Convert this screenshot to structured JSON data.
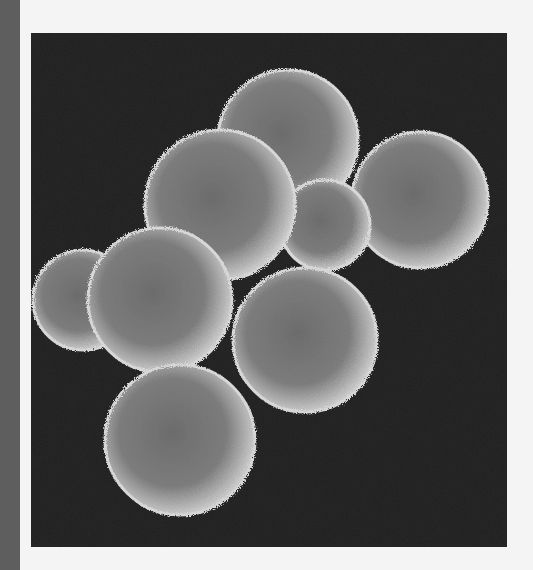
{
  "page": {
    "background_color": "#f4f4f4",
    "left_bar_color": "#5e5e5e"
  },
  "image": {
    "subject": "scanning electron micrograph of a cluster of spherical cells (early embryo / blastomeres)",
    "background_color": "#1f1f1f",
    "cell_count_visible": 8,
    "cells": [
      {
        "name": "cell-far-left",
        "cx": 52,
        "cy": 267,
        "r": 50
      },
      {
        "name": "cell-top-center",
        "cx": 257,
        "cy": 107,
        "r": 70
      },
      {
        "name": "cell-right",
        "cx": 389,
        "cy": 167,
        "r": 68
      },
      {
        "name": "cell-middle-back",
        "cx": 294,
        "cy": 192,
        "r": 45
      },
      {
        "name": "cell-upper-left",
        "cx": 189,
        "cy": 172,
        "r": 75
      },
      {
        "name": "cell-left-middle",
        "cx": 129,
        "cy": 267,
        "r": 72
      },
      {
        "name": "cell-center-right",
        "cx": 274,
        "cy": 307,
        "r": 72
      },
      {
        "name": "cell-bottom-left",
        "cx": 149,
        "cy": 407,
        "r": 75
      }
    ]
  }
}
